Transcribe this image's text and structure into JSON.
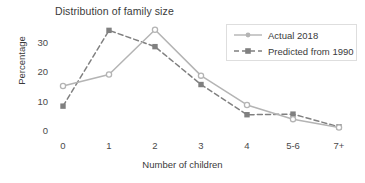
{
  "chart_data": {
    "type": "line",
    "title": "Distribution of family size",
    "xlabel": "Number of children",
    "ylabel": "Percentage",
    "categories": [
      "0",
      "1",
      "2",
      "3",
      "4",
      "5-6",
      "7+"
    ],
    "series": [
      {
        "name": "Actual 2018",
        "values": [
          15.2,
          19.1,
          34.2,
          18.7,
          8.8,
          4.0,
          1.2
        ],
        "color": "#b4b4b4",
        "line_style": "solid",
        "marker": "circle"
      },
      {
        "name": "Predicted from 1990",
        "values": [
          8.4,
          34.0,
          28.5,
          15.7,
          5.5,
          5.7,
          1.4
        ],
        "color": "#808080",
        "line_style": "dashed",
        "marker": "square"
      }
    ],
    "yticks": [
      0,
      10,
      20,
      30
    ],
    "ylim": [
      0,
      36
    ],
    "grid": false,
    "legend_position": "top-right",
    "legend_entries": [
      "Actual 2018",
      "Predicted from 1990"
    ]
  },
  "axis": {
    "yticks": [
      "30",
      "20",
      "10",
      "0"
    ],
    "xticks": [
      "0",
      "1",
      "2",
      "3",
      "4",
      "5-6",
      "7+"
    ]
  },
  "colors": {
    "actual": "#b4b4b4",
    "predicted": "#808080",
    "text": "#3a3a3a",
    "legend_border": "#dedede",
    "background": "#ffffff"
  }
}
